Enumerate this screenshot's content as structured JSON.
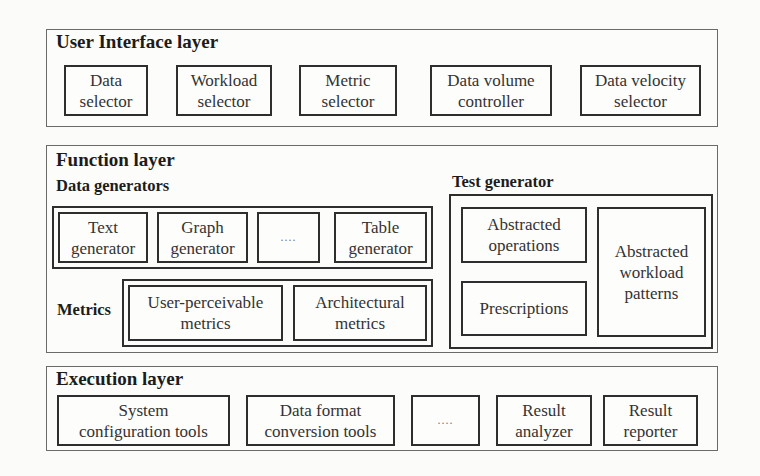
{
  "diagram": {
    "ui_layer": {
      "title": "User Interface layer",
      "components": [
        {
          "label": "Data\nselector"
        },
        {
          "label": "Workload\nselector"
        },
        {
          "label": "Metric\nselector"
        },
        {
          "label": "Data volume\ncontroller"
        },
        {
          "label": "Data velocity\nselector"
        }
      ]
    },
    "function_layer": {
      "title": "Function layer",
      "data_generators": {
        "title": "Data generators",
        "components": [
          {
            "label": "Text\ngenerator"
          },
          {
            "label": "Graph\ngenerator"
          },
          {
            "label": "...."
          },
          {
            "label": "Table\ngenerator"
          }
        ]
      },
      "metrics": {
        "title": "Metrics",
        "components": [
          {
            "label": "User-perceivable\nmetrics"
          },
          {
            "label": "Architectural\nmetrics"
          }
        ]
      },
      "test_generator": {
        "title": "Test generator",
        "components": [
          {
            "label": "Abstracted\noperations"
          },
          {
            "label": "Prescriptions"
          },
          {
            "label": "Abstracted\nworkload\npatterns"
          }
        ]
      }
    },
    "execution_layer": {
      "title": "Execution layer",
      "components": [
        {
          "label": "System\nconfiguration tools"
        },
        {
          "label": "Data format\nconversion tools"
        },
        {
          "label": "...."
        },
        {
          "label": "Result\nanalyzer"
        },
        {
          "label": "Result\nreporter"
        }
      ]
    }
  },
  "colors": {
    "background": "#fbfbf9",
    "border": "#2e2e2e",
    "layer_border": "#6a6a6a",
    "text": "#222222"
  }
}
